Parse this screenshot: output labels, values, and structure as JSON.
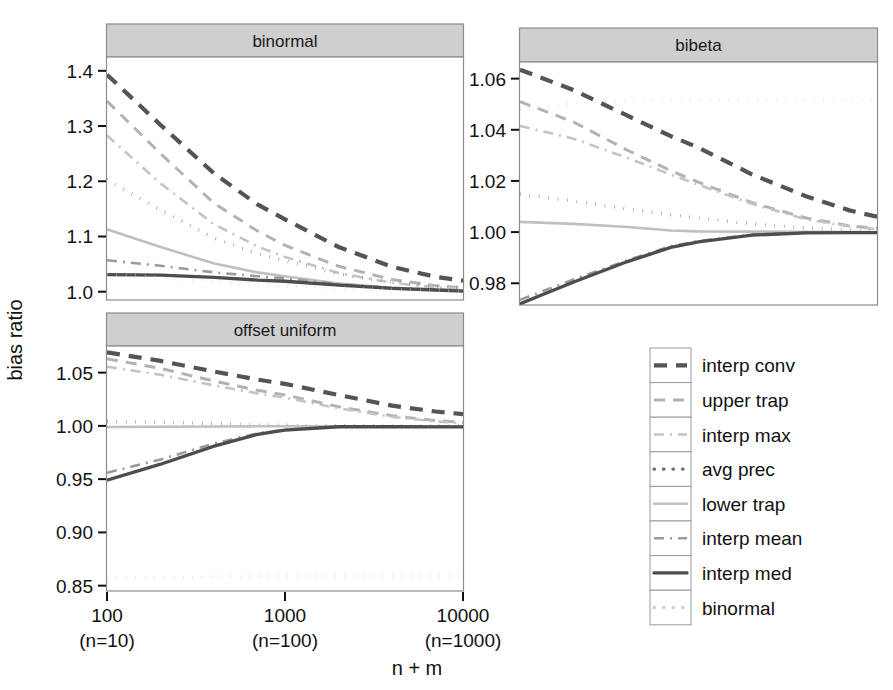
{
  "figure": {
    "ylabel": "bias ratio",
    "xlabel": "n + m"
  },
  "panels": [
    {
      "id": "binormal",
      "title": "binormal"
    },
    {
      "id": "bibeta",
      "title": "bibeta"
    },
    {
      "id": "offset-uniform",
      "title": "offset uniform"
    }
  ],
  "xaxis": {
    "ticks": [
      {
        "top": "100",
        "bottom": "(n=10)"
      },
      {
        "top": "1000",
        "bottom": "(n=100)"
      },
      {
        "top": "10000",
        "bottom": "(n=1000)"
      }
    ]
  },
  "yaxis": {
    "binormal": [
      "1.4",
      "1.3",
      "1.2",
      "1.1",
      "1.0"
    ],
    "bibeta": [
      "1.06",
      "1.04",
      "1.02",
      "1.00",
      "0.98"
    ],
    "offset_uniform": [
      "1.05",
      "1.00",
      "0.95",
      "0.90",
      "0.85"
    ]
  },
  "legend": {
    "items": [
      {
        "label": "interp conv",
        "style": "dashed-thick",
        "color": "#545454"
      },
      {
        "label": "upper trap",
        "style": "dashed",
        "color": "#b3b3b3"
      },
      {
        "label": "interp max",
        "style": "dash-dot",
        "color": "#c4c4c4"
      },
      {
        "label": "avg prec",
        "style": "dotted",
        "color": "#6e6e6e"
      },
      {
        "label": "lower trap",
        "style": "solid",
        "color": "#c0c0c0"
      },
      {
        "label": "interp mean",
        "style": "dash-dot",
        "color": "#9b9b9b"
      },
      {
        "label": "interp med",
        "style": "solid-thick",
        "color": "#4d4d4d"
      },
      {
        "label": "binormal",
        "style": "dotted",
        "color": "#d2d2d2"
      }
    ]
  },
  "chart_data": {
    "type": "line",
    "title": "",
    "xlabel": "n + m",
    "ylabel": "bias ratio",
    "xscale": "log10",
    "x": [
      100,
      200,
      400,
      700,
      1000,
      2000,
      4000,
      7000,
      10000
    ],
    "xtick_values": [
      100,
      1000,
      10000
    ],
    "xtick_labels": [
      "100\n(n=10)",
      "1000\n(n=100)",
      "10000\n(n=1000)"
    ],
    "grid": false,
    "legend_position": "right",
    "panels": [
      {
        "name": "binormal",
        "ylim": [
          0.985,
          1.425
        ],
        "yticks": [
          1.0,
          1.1,
          1.2,
          1.3,
          1.4
        ],
        "series": [
          {
            "name": "interp conv",
            "values": [
              1.393,
              1.302,
              1.214,
              1.158,
              1.131,
              1.081,
              1.045,
              1.027,
              1.02
            ]
          },
          {
            "name": "upper trap",
            "values": [
              1.345,
              1.25,
              1.16,
              1.11,
              1.084,
              1.046,
              1.022,
              1.011,
              1.007
            ]
          },
          {
            "name": "interp max",
            "values": [
              1.283,
              1.196,
              1.122,
              1.082,
              1.063,
              1.034,
              1.016,
              1.008,
              1.005
            ]
          },
          {
            "name": "avg prec",
            "values": [
              1.203,
              1.148,
              1.097,
              1.069,
              1.056,
              1.032,
              1.017,
              1.01,
              1.007
            ]
          },
          {
            "name": "lower trap",
            "values": [
              1.113,
              1.081,
              1.051,
              1.035,
              1.028,
              1.015,
              1.007,
              1.003,
              1.002
            ]
          },
          {
            "name": "interp mean",
            "values": [
              1.057,
              1.047,
              1.035,
              1.028,
              1.024,
              1.014,
              1.007,
              1.004,
              1.002
            ]
          },
          {
            "name": "interp med",
            "values": [
              1.031,
              1.03,
              1.026,
              1.021,
              1.019,
              1.012,
              1.006,
              1.003,
              1.001
            ]
          },
          {
            "name": "binormal",
            "values": [
              1.033,
              1.026,
              1.018,
              1.012,
              1.01,
              1.007,
              1.004,
              1.002,
              1.001
            ]
          }
        ]
      },
      {
        "name": "bibeta",
        "ylim": [
          0.9715,
          1.0665
        ],
        "yticks": [
          0.98,
          1.0,
          1.02,
          1.04,
          1.06
        ],
        "series": [
          {
            "name": "interp conv",
            "values": [
              1.0635,
              1.0555,
              1.0455,
              1.0375,
              1.033,
              1.0225,
              1.014,
              1.0085,
              1.006
            ]
          },
          {
            "name": "upper trap",
            "values": [
              1.051,
              1.043,
              1.032,
              1.024,
              1.0195,
              1.0115,
              1.0055,
              1.0025,
              1.0015
            ]
          },
          {
            "name": "interp max",
            "values": [
              1.0415,
              1.0365,
              1.029,
              1.0225,
              1.0185,
              1.011,
              1.005,
              1.0022,
              1.0012
            ]
          },
          {
            "name": "avg prec",
            "values": [
              1.0148,
              1.0122,
              1.009,
              1.0068,
              1.0055,
              1.0032,
              1.0016,
              1.0008,
              1.0005
            ]
          },
          {
            "name": "lower trap",
            "values": [
              1.004,
              1.0032,
              1.002,
              1.0006,
              1.0003,
              1.0002,
              1.0001,
              1.0,
              1.0
            ]
          },
          {
            "name": "interp mean",
            "values": [
              0.9735,
              0.9815,
              0.989,
              0.9945,
              0.9965,
              0.999,
              0.9998,
              0.9999,
              0.9999
            ]
          },
          {
            "name": "interp med",
            "values": [
              0.972,
              0.9805,
              0.9885,
              0.994,
              0.9962,
              0.9988,
              0.9997,
              0.9998,
              0.9998
            ]
          },
          {
            "name": "binormal",
            "values": [
              1.048,
              1.0505,
              1.0513,
              1.0516,
              1.0517,
              1.0518,
              1.0519,
              1.052,
              1.052
            ]
          }
        ]
      },
      {
        "name": "offset uniform",
        "ylim": [
          0.845,
          1.075
        ],
        "yticks": [
          0.85,
          0.9,
          0.95,
          1.0,
          1.05
        ],
        "series": [
          {
            "name": "interp conv",
            "values": [
              1.069,
              1.061,
              1.051,
              1.0435,
              1.0395,
              1.029,
              1.019,
              1.0135,
              1.011
            ]
          },
          {
            "name": "upper trap",
            "values": [
              1.063,
              1.054,
              1.042,
              1.0335,
              1.029,
              1.018,
              1.0095,
              1.005,
              1.0032
            ]
          },
          {
            "name": "interp max",
            "values": [
              1.0555,
              1.048,
              1.038,
              1.0305,
              1.0265,
              1.0165,
              1.0085,
              1.0042,
              1.0026
            ]
          },
          {
            "name": "avg prec",
            "values": [
              1.0042,
              1.0035,
              1.0022,
              1.001,
              1.0006,
              1.0002,
              1.0,
              0.9999,
              0.9999
            ]
          },
          {
            "name": "lower trap",
            "values": [
              0.999,
              0.9992,
              0.9994,
              0.9996,
              0.9996,
              0.9997,
              0.9997,
              0.9997,
              0.9997
            ]
          },
          {
            "name": "interp mean",
            "values": [
              0.956,
              0.9685,
              0.9835,
              0.993,
              0.9965,
              0.9995,
              0.9994,
              0.9993,
              0.9993
            ]
          },
          {
            "name": "interp med",
            "values": [
              0.949,
              0.964,
              0.981,
              0.992,
              0.996,
              0.9992,
              0.9992,
              0.9991,
              0.9991
            ]
          },
          {
            "name": "binormal",
            "values": [
              0.857,
              0.858,
              0.8585,
              0.8588,
              0.8589,
              0.859,
              0.8591,
              0.8592,
              0.8592
            ]
          }
        ]
      }
    ]
  }
}
